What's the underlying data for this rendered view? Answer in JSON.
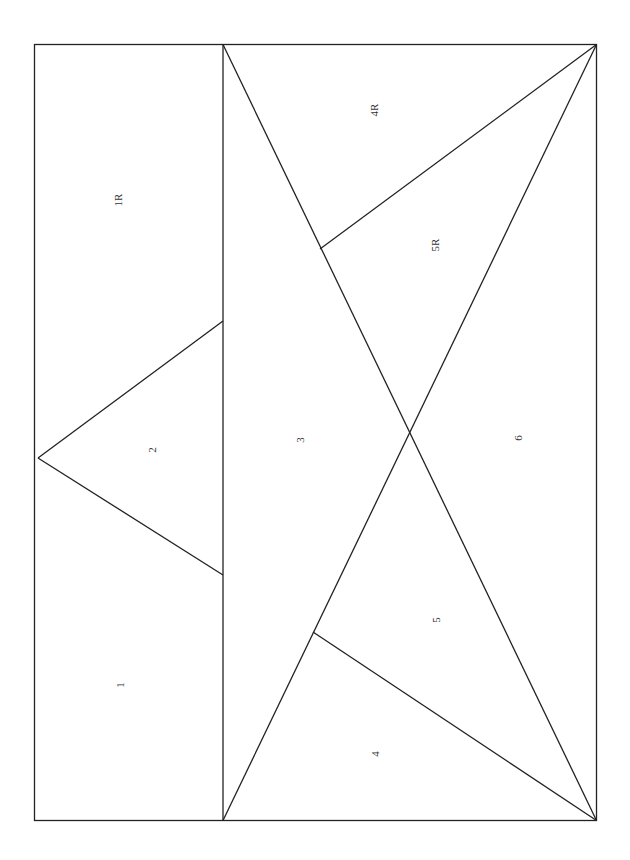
{
  "diagram": {
    "type": "pattern-layout",
    "stroke_color": "#222222",
    "background": "#ffffff",
    "pieces": [
      {
        "id": "piece-1R",
        "label": "1R"
      },
      {
        "id": "piece-1",
        "label": "1"
      },
      {
        "id": "piece-2",
        "label": "2"
      },
      {
        "id": "piece-3",
        "label": "3"
      },
      {
        "id": "piece-4R",
        "label": "4R"
      },
      {
        "id": "piece-5R",
        "label": "5R"
      },
      {
        "id": "piece-6",
        "label": "6"
      },
      {
        "id": "piece-5",
        "label": "5"
      },
      {
        "id": "piece-4",
        "label": "4"
      }
    ],
    "label_orientation": "rotated-counterclockwise"
  }
}
